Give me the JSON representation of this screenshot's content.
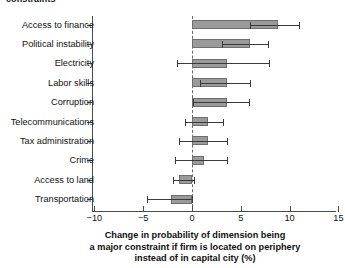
{
  "chart_data": {
    "type": "bar",
    "orientation": "horizontal",
    "title": "constraints",
    "xlabel": "Change in probability of dimension being a major constraint if firm is located on periphery instead of in capital city (%)",
    "xlabel_lines": [
      "Change in probability of dimension being",
      "a major constraint if firm is located on periphery",
      "instead of in capital city (%)"
    ],
    "ylabel": "",
    "xlim": [
      -10,
      15
    ],
    "xticks": [
      -10,
      -5,
      0,
      5,
      10,
      15
    ],
    "xticklabels": [
      "−10",
      "−5",
      "0",
      "5",
      "10",
      "15"
    ],
    "grid": false,
    "legend": null,
    "reference_line": {
      "value": 0,
      "style": "dashed"
    },
    "error_bars": true,
    "categories": [
      "Access to finance",
      "Political instability",
      "Electricity",
      "Labor skills",
      "Corruption",
      "Telecommunications",
      "Tax administration",
      "Crime",
      "Access to land",
      "Transportation"
    ],
    "values": [
      8.8,
      5.9,
      3.6,
      3.6,
      3.6,
      1.6,
      1.6,
      1.2,
      -1.3,
      -2.2
    ],
    "error_low": [
      5.9,
      3.1,
      -1.5,
      0.8,
      0.1,
      -0.7,
      -1.3,
      -1.7,
      -1.9,
      -4.6
    ],
    "error_high": [
      11.0,
      7.8,
      7.9,
      5.9,
      5.8,
      3.2,
      3.6,
      3.6,
      0.2,
      0.0
    ],
    "bar_color": "#9a9a9a",
    "bar_edge_color": "#6e6e6e",
    "error_color": "#3a3a3a",
    "axis_color": "#4a4a4a"
  }
}
